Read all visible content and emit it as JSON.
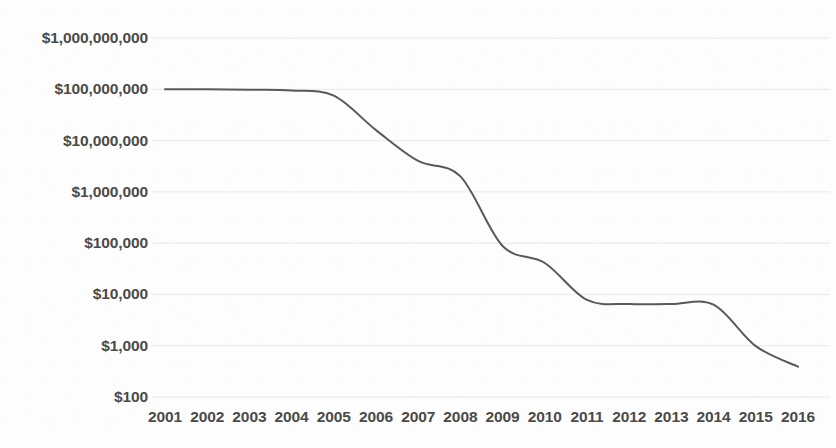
{
  "chart_data": {
    "type": "line",
    "title": "",
    "subtitle": "",
    "xlabel": "",
    "ylabel": "",
    "yscale": "log",
    "grid": true,
    "legend": "none",
    "line_color": "#595959",
    "line_width": 2,
    "background_color": "#ffffff",
    "tick_color": "#4a4a4a",
    "gridline_color": "#e8e8e8",
    "x": [
      2001,
      2002,
      2003,
      2004,
      2005,
      2006,
      2007,
      2008,
      2009,
      2010,
      2011,
      2012,
      2013,
      2014,
      2015,
      2016
    ],
    "categories": [
      "2001",
      "2002",
      "2003",
      "2004",
      "2005",
      "2006",
      "2007",
      "2008",
      "2009",
      "2010",
      "2011",
      "2012",
      "2013",
      "2014",
      "2015",
      "2016"
    ],
    "values": [
      100000000,
      100000000,
      98000000,
      95000000,
      75000000,
      16000000,
      4000000,
      2000000,
      88000,
      41000,
      7800,
      6500,
      6500,
      6300,
      980,
      390
    ],
    "series": [
      {
        "name": "cost",
        "values": [
          100000000,
          100000000,
          98000000,
          95000000,
          75000000,
          16000000,
          4000000,
          2000000,
          88000,
          41000,
          7800,
          6500,
          6500,
          6300,
          980,
          390
        ]
      }
    ],
    "ylim": [
      100,
      1000000000
    ],
    "xlim": [
      2001,
      2016
    ],
    "ytick_values": [
      1000000000,
      100000000,
      10000000,
      1000000,
      100000,
      10000,
      1000,
      100
    ],
    "ytick_labels": [
      "$1,000,000,000",
      "$100,000,000",
      "$10,000,000",
      "$1,000,000",
      "$100,000",
      "$10,000",
      "$1,000",
      "$100"
    ],
    "xtick_labels": [
      "2001",
      "2002",
      "2003",
      "2004",
      "2005",
      "2006",
      "2007",
      "2008",
      "2009",
      "2010",
      "2011",
      "2012",
      "2013",
      "2014",
      "2015",
      "2016"
    ]
  }
}
